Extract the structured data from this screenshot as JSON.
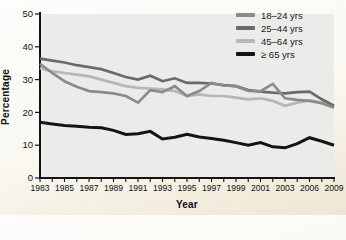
{
  "figure": {
    "y_axis_title": "Percentage",
    "x_axis_title": "Year"
  },
  "chart_data": {
    "type": "line",
    "title": "",
    "xlabel": "Year",
    "ylabel": "Percentage",
    "ylim": [
      0,
      50
    ],
    "y_ticks": [
      0,
      10,
      20,
      30,
      40,
      50
    ],
    "x_tick_labels": [
      "1983",
      "1985",
      "1987",
      "1989",
      "1991",
      "1993",
      "1995",
      "1997",
      "1999",
      "2001",
      "2003",
      "2006",
      "2009"
    ],
    "minor_ticks_between_labels": 1,
    "grid": false,
    "legend_position": "top-right-inside",
    "plot_bg": "#ebebe9",
    "axis_color": "#141414",
    "series": [
      {
        "name": "18–24 yrs",
        "color": "#8b8b8b",
        "values": [
          34.8,
          32.0,
          29.5,
          27.8,
          26.5,
          26.2,
          25.8,
          25.0,
          23.0,
          26.8,
          26.2,
          28.0,
          25.0,
          26.5,
          29.0,
          28.2,
          28.0,
          26.6,
          26.5,
          28.7,
          24.3,
          23.8,
          23.5,
          22.8,
          21.4
        ]
      },
      {
        "name": "25–44 yrs",
        "color": "#6a6a6a",
        "values": [
          36.4,
          35.8,
          35.2,
          34.4,
          33.8,
          33.2,
          32.0,
          30.8,
          30.0,
          31.2,
          29.5,
          30.4,
          29.0,
          29.0,
          28.8,
          28.3,
          28.0,
          26.8,
          26.3,
          26.0,
          25.8,
          26.2,
          26.3,
          24.0,
          22.0
        ]
      },
      {
        "name": "45–64 yrs",
        "color": "#b5b8b3",
        "values": [
          33.5,
          32.5,
          32.0,
          31.5,
          31.0,
          30.0,
          29.0,
          28.0,
          27.5,
          27.3,
          27.0,
          26.5,
          25.0,
          25.5,
          25.0,
          25.0,
          24.5,
          24.0,
          24.3,
          23.5,
          22.0,
          23.0,
          23.7,
          23.0,
          21.8
        ]
      },
      {
        "name": "≥ 65 yrs",
        "color": "#141414",
        "values": [
          17.0,
          16.5,
          16.0,
          15.8,
          15.5,
          15.3,
          14.5,
          13.3,
          13.5,
          14.2,
          11.9,
          12.4,
          13.3,
          12.5,
          12.0,
          11.5,
          10.8,
          10.0,
          10.8,
          9.5,
          9.2,
          10.5,
          12.3,
          11.2,
          10.0
        ]
      }
    ]
  }
}
